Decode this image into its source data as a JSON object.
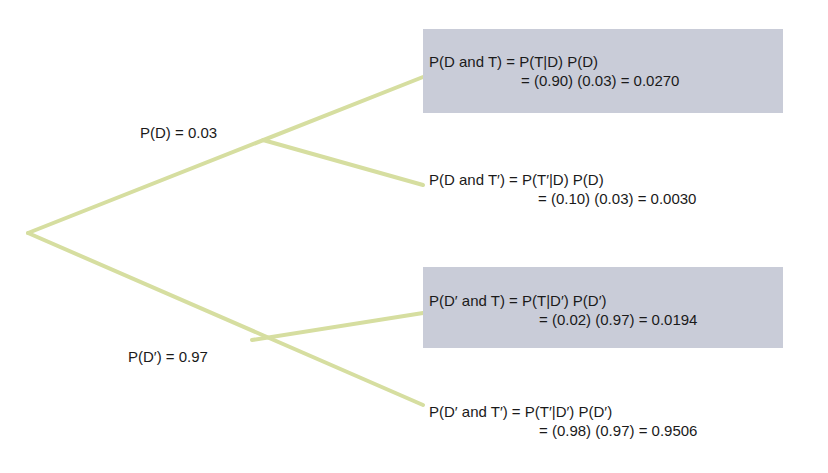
{
  "branch_color": "#d6dea0",
  "box_color": "#c9ccd8",
  "first_level": {
    "D": {
      "label": "P(D) = 0.03",
      "prob": 0.03
    },
    "D_prime": {
      "label": "P(D′) = 0.97",
      "prob": 0.97
    }
  },
  "outcomes": [
    {
      "highlighted": true,
      "line1": "P(D and T) = P(T|D) P(D)",
      "line2": "= (0.90) (0.03) = 0.0270",
      "conditional": 0.9,
      "prior": 0.03,
      "joint": 0.027
    },
    {
      "highlighted": false,
      "line1": "P(D and T′) = P(T′|D) P(D)",
      "line2": "= (0.10) (0.03) = 0.0030",
      "conditional": 0.1,
      "prior": 0.03,
      "joint": 0.003
    },
    {
      "highlighted": true,
      "line1": "P(D′ and T) = P(T|D′) P(D′)",
      "line2": "= (0.02) (0.97) = 0.0194",
      "conditional": 0.02,
      "prior": 0.97,
      "joint": 0.0194
    },
    {
      "highlighted": false,
      "line1": "P(D′ and T′) = P(T′|D′) P(D′)",
      "line2": "= (0.98) (0.97) = 0.9506",
      "conditional": 0.98,
      "prior": 0.97,
      "joint": 0.9506
    }
  ]
}
